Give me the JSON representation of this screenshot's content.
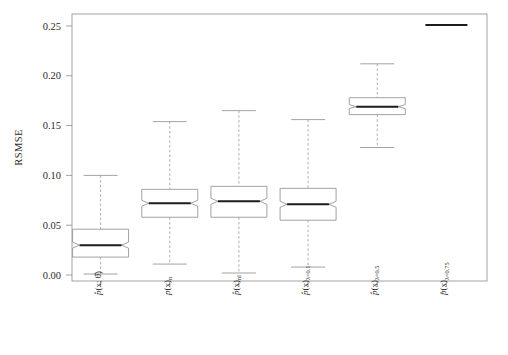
{
  "chart_data": {
    "type": "boxplot",
    "title": "",
    "subtitle": "",
    "xlabel": "",
    "ylabel": "RSMSE",
    "ylim": [
      -0.006,
      0.262
    ],
    "yticks": [
      0.0,
      0.05,
      0.1,
      0.15,
      0.2,
      0.25
    ],
    "ytick_labels": [
      "0.00",
      "0.05",
      "0.10",
      "0.15",
      "0.20",
      "0.25"
    ],
    "grid": false,
    "legend": null,
    "notched": true,
    "categories": [
      "p̂(x; θ̂)",
      "pₙ(x)",
      "p̂(x)ₙₗ",
      "p̂(x)λ=0.1",
      "p̂(x)λ=0.5",
      "p̂(x)λ=0.75"
    ],
    "boxes": [
      {
        "category": "p̂(x; θ̂)",
        "whisker_low": 0.001,
        "q1": 0.018,
        "median": 0.03,
        "q3": 0.046,
        "whisker_high": 0.1,
        "notch_low": 0.027,
        "notch_high": 0.033,
        "outliers": []
      },
      {
        "category": "pₙ(x)",
        "whisker_low": 0.011,
        "q1": 0.058,
        "median": 0.072,
        "q3": 0.086,
        "whisker_high": 0.154,
        "notch_low": 0.069,
        "notch_high": 0.075,
        "outliers": []
      },
      {
        "category": "p̂(x)ₙₗ",
        "whisker_low": 0.002,
        "q1": 0.058,
        "median": 0.074,
        "q3": 0.089,
        "whisker_high": 0.165,
        "notch_low": 0.071,
        "notch_high": 0.077,
        "outliers": []
      },
      {
        "category": "p̂(x)λ=0.1",
        "whisker_low": 0.008,
        "q1": 0.055,
        "median": 0.071,
        "q3": 0.087,
        "whisker_high": 0.156,
        "notch_low": 0.068,
        "notch_high": 0.074,
        "outliers": []
      },
      {
        "category": "p̂(x)λ=0.5",
        "whisker_low": 0.128,
        "q1": 0.161,
        "median": 0.169,
        "q3": 0.178,
        "whisker_high": 0.212,
        "notch_low": 0.167,
        "notch_high": 0.171,
        "outliers": []
      },
      {
        "category": "p̂(x)λ=0.75",
        "whisker_low": 0.251,
        "q1": 0.251,
        "median": 0.251,
        "q3": 0.251,
        "whisker_high": 0.251,
        "notch_low": 0.251,
        "notch_high": 0.251,
        "outliers": []
      }
    ]
  },
  "axis": {
    "y_title": "RSMSE",
    "y_tick_labels": [
      "0.25",
      "0.20",
      "0.15",
      "0.10",
      "0.05",
      "0.00"
    ]
  },
  "x_labels": [
    {
      "base": "p̂",
      "arg": "(x; θ̂)",
      "sub": ""
    },
    {
      "base": "p",
      "arg": "(x)",
      "sub": "n"
    },
    {
      "base": "p̂",
      "arg": "(x)",
      "sub": "nl"
    },
    {
      "base": "p̂",
      "arg": "(x)",
      "sub": "λ=0.1"
    },
    {
      "base": "p̂",
      "arg": "(x)",
      "sub": "λ=0.5"
    },
    {
      "base": "p̂",
      "arg": "(x)",
      "sub": "λ=0.75"
    }
  ],
  "colors": {
    "frame": "#8c8c8c",
    "box_stroke": "#8c8c8c",
    "box_fill": "#ffffff",
    "median": "#1d1d1d",
    "whisker": "#9a9a9a",
    "text": "#2b2b2b",
    "background": "#ffffff"
  }
}
